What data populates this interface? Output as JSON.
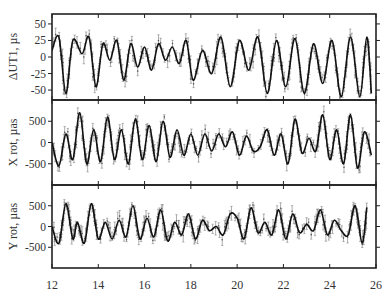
{
  "chart_data": [
    {
      "type": "line",
      "panel": "top",
      "title": "",
      "xlabel": "",
      "ylabel": "ΔUT1, µs",
      "xlim": [
        12,
        26
      ],
      "ylim": [
        -65,
        65
      ],
      "yticks": [
        50,
        25,
        0,
        -25,
        -50
      ],
      "ytick_labels": [
        "50",
        "25",
        "0",
        "-25",
        "-50"
      ],
      "grid": false,
      "legend": null,
      "series": [
        {
          "name": "model (solid line)",
          "style": "solid",
          "x": [
            12.0,
            12.3,
            12.6,
            12.9,
            13.3,
            13.6,
            13.9,
            14.2,
            14.5,
            14.8,
            15.1,
            15.4,
            15.7,
            16.0,
            16.3,
            16.6,
            16.9,
            17.2,
            17.5,
            17.8,
            18.1,
            18.5,
            18.9,
            19.3,
            19.7,
            20.1,
            20.5,
            20.9,
            21.3,
            21.7,
            22.1,
            22.5,
            22.9,
            23.3,
            23.7,
            24.1,
            24.5,
            24.9,
            25.3,
            25.6,
            25.8
          ],
          "y": [
            10,
            30,
            -55,
            25,
            5,
            30,
            -45,
            20,
            -5,
            25,
            -35,
            20,
            -15,
            15,
            -20,
            20,
            -5,
            15,
            -10,
            25,
            -35,
            10,
            -25,
            30,
            -45,
            25,
            -20,
            30,
            -55,
            25,
            -45,
            28,
            -55,
            20,
            -40,
            25,
            -60,
            30,
            -60,
            30,
            -55
          ]
        },
        {
          "name": "observations with error bars",
          "style": "markers",
          "note": "scattered points around the model curve, error bars ~±5–10 µs"
        }
      ]
    },
    {
      "type": "line",
      "panel": "middle",
      "title": "",
      "xlabel": "",
      "ylabel": "X rot, µas",
      "xlim": [
        12,
        26
      ],
      "ylim": [
        -1000,
        1000
      ],
      "yticks": [
        500,
        0,
        -500
      ],
      "ytick_labels": [
        "500",
        "0",
        "-500"
      ],
      "grid": false,
      "legend": null,
      "series": [
        {
          "name": "model (solid line)",
          "style": "solid",
          "x": [
            12.0,
            12.3,
            12.6,
            12.9,
            13.2,
            13.5,
            13.8,
            14.1,
            14.4,
            14.7,
            15.0,
            15.3,
            15.6,
            15.9,
            16.2,
            16.5,
            16.8,
            17.1,
            17.4,
            17.7,
            18.0,
            18.3,
            18.6,
            18.9,
            19.2,
            19.5,
            19.8,
            20.1,
            20.4,
            20.7,
            21.0,
            21.3,
            21.6,
            21.9,
            22.2,
            22.5,
            22.8,
            23.1,
            23.4,
            23.7,
            24.0,
            24.3,
            24.6,
            24.9,
            25.2,
            25.5,
            25.8
          ],
          "y": [
            0,
            -550,
            200,
            -400,
            700,
            -500,
            300,
            -450,
            600,
            -400,
            300,
            -500,
            550,
            -400,
            400,
            -450,
            500,
            -350,
            300,
            -300,
            200,
            -300,
            200,
            -200,
            200,
            -100,
            250,
            -300,
            150,
            -200,
            -100,
            300,
            -300,
            200,
            -500,
            550,
            -250,
            100,
            -200,
            650,
            -400,
            300,
            -500,
            650,
            -600,
            250,
            -300
          ]
        },
        {
          "name": "observations with error bars",
          "style": "markers",
          "note": "scattered points around the model curve, error bars ~±100–200 µas"
        }
      ]
    },
    {
      "type": "line",
      "panel": "bottom",
      "title": "",
      "xlabel": "",
      "ylabel": "Y rot, µas",
      "xlim": [
        12,
        26
      ],
      "ylim": [
        -1000,
        1000
      ],
      "yticks": [
        500,
        0,
        -500
      ],
      "ytick_labels": [
        "500",
        "0",
        "-500"
      ],
      "xticks": [
        12,
        14,
        16,
        18,
        20,
        22,
        24,
        26
      ],
      "xtick_labels": [
        "12",
        "14",
        "16",
        "18",
        "20",
        "22",
        "24",
        "26"
      ],
      "grid": false,
      "legend": null,
      "series": [
        {
          "name": "model (solid line)",
          "style": "solid",
          "x": [
            12.0,
            12.3,
            12.6,
            12.9,
            13.1,
            13.4,
            13.7,
            14.0,
            14.3,
            14.6,
            14.9,
            15.2,
            15.5,
            15.8,
            16.1,
            16.4,
            16.7,
            17.0,
            17.3,
            17.6,
            17.9,
            18.2,
            18.5,
            18.8,
            19.1,
            19.4,
            19.7,
            20.0,
            20.3,
            20.6,
            20.9,
            21.2,
            21.5,
            21.8,
            22.1,
            22.4,
            22.7,
            23.0,
            23.3,
            23.6,
            23.9,
            24.2,
            24.5,
            24.8,
            25.1,
            25.4,
            25.6
          ],
          "y": [
            0,
            -400,
            550,
            -300,
            100,
            -400,
            550,
            -300,
            100,
            -300,
            150,
            -250,
            500,
            -300,
            200,
            -250,
            400,
            -350,
            100,
            -200,
            300,
            -300,
            150,
            -100,
            0,
            -200,
            300,
            200,
            -300,
            450,
            -150,
            100,
            -200,
            400,
            -300,
            300,
            -150,
            50,
            -100,
            400,
            -200,
            150,
            -100,
            -200,
            500,
            -400,
            450
          ]
        },
        {
          "name": "observations with error bars",
          "style": "markers",
          "note": "scattered points around the model curve, error bars ~±100–200 µas"
        }
      ]
    }
  ],
  "labels": {
    "panel_top_ylabel": "ΔUT1, µs",
    "panel_middle_ylabel": "X rot, µas",
    "panel_bottom_ylabel": "Y rot, µas"
  }
}
